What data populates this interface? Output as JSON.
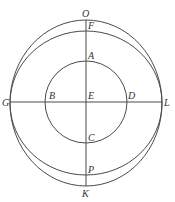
{
  "diagram": {
    "type": "geometric-figure",
    "stroke_color": "#4a4a4a",
    "label_color": "#333333",
    "center": {
      "name": "E",
      "x": 86,
      "y": 102
    },
    "shapes": {
      "inner_circle": {
        "cx": 86,
        "cy": 102,
        "r": 41,
        "through": [
          "A",
          "B",
          "C",
          "D"
        ]
      },
      "outer_curve": {
        "cx": 86,
        "cy": 103,
        "rx": 76,
        "ry": 83,
        "through": [
          "O",
          "G",
          "K",
          "L"
        ]
      },
      "middle_curve": {
        "cx": 86,
        "cy": 103,
        "rx": 76,
        "ry": 72,
        "through": [
          "F",
          "G",
          "P",
          "L"
        ]
      },
      "vertical_line": {
        "from": "O",
        "to": "K",
        "x": 86,
        "y1": 20,
        "y2": 186
      },
      "horizontal_line": {
        "from": "G",
        "to": "L",
        "y": 102,
        "x1": 10,
        "x2": 162
      }
    },
    "labels": {
      "O": "O",
      "F": "F",
      "A": "A",
      "B": "B",
      "E": "E",
      "D": "D",
      "G": "G",
      "L": "L",
      "C": "C",
      "P": "P",
      "K": "K"
    }
  }
}
